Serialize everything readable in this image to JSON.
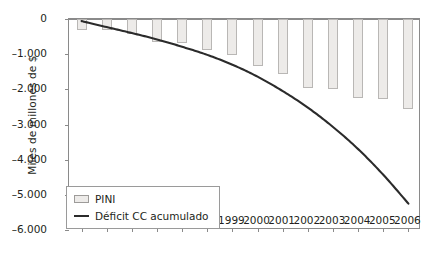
{
  "chart_data": {
    "type": "bar",
    "title": "",
    "xlabel": "",
    "ylabel": "Miles de millones de $",
    "ylim": [
      -6000,
      0
    ],
    "ytick_values": [
      0,
      -1000,
      -2000,
      -3000,
      -4000,
      -5000,
      -6000
    ],
    "ytick_labels": [
      "0",
      "–1.000",
      "–2.000",
      "–3.000",
      "–4.000",
      "–5.000",
      "–6.000"
    ],
    "grid": false,
    "legend_position": "lower-left",
    "categories": [
      "1993",
      "1994",
      "1995",
      "1996",
      "1997",
      "1998",
      "1999",
      "2000",
      "2001",
      "2002",
      "2003",
      "2004",
      "2005",
      "2006"
    ],
    "series": [
      {
        "name": "PINI",
        "type": "bar",
        "values": [
          -310,
          -300,
          -430,
          -660,
          -690,
          -870,
          -1020,
          -1330,
          -1560,
          -1960,
          -2000,
          -2260,
          -2270,
          -2550
        ]
      },
      {
        "name": "Déficit CC acumulado",
        "type": "line",
        "values": [
          -60,
          -230,
          -400,
          -580,
          -790,
          -1020,
          -1300,
          -1640,
          -2050,
          -2520,
          -3070,
          -3700,
          -4430,
          -5250
        ]
      }
    ]
  },
  "legend": {
    "items": [
      {
        "label": "PINI",
        "marker": "bar-swatch",
        "color": "#edebe9"
      },
      {
        "label": "Déficit CC acumulado",
        "marker": "line-swatch",
        "color": "#2b2b2b"
      }
    ]
  },
  "colors": {
    "bar_fill": "#edebe9",
    "bar_stroke": "#b9b7b5",
    "line": "#2b2b2b",
    "axis": "#8a8a8a",
    "text": "#231f20",
    "background": "#ffffff"
  }
}
